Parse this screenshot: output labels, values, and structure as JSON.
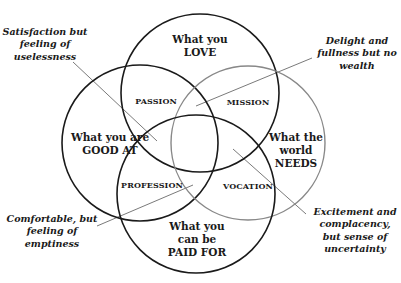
{
  "diagram": {
    "type": "four-circle-venn",
    "stroke_color": "#1a1a1a",
    "leader_color": "#7a7a7a",
    "circles": [
      {
        "id": "love",
        "lines": [
          "What you",
          "LOVE"
        ],
        "cx": 200,
        "cy": 93,
        "r": 79
      },
      {
        "id": "good_at",
        "lines": [
          "What you are",
          "GOOD AT"
        ],
        "cx": 140,
        "cy": 143,
        "r": 78
      },
      {
        "id": "needs",
        "lines": [
          "What the",
          "world",
          "NEEDS"
        ],
        "cx": 248,
        "cy": 143,
        "r": 77
      },
      {
        "id": "paid_for",
        "lines": [
          "What you",
          "can be",
          "PAID FOR"
        ],
        "cx": 196,
        "cy": 194,
        "r": 79
      }
    ],
    "zones": {
      "passion": "PASSION",
      "mission": "MISSION",
      "profession": "PROFESSION",
      "vocation": "VOCATION"
    },
    "annotations": {
      "top_left": [
        "Satisfaction but",
        "feeling of",
        "uselessness"
      ],
      "top_right": [
        "Delight and",
        "fullness but no",
        "wealth"
      ],
      "bottom_left": [
        "Comfortable, but",
        "feeling of",
        "emptiness"
      ],
      "bottom_right": [
        "Excitement and",
        "complacency,",
        "but sense of",
        "uncertainty"
      ]
    }
  }
}
